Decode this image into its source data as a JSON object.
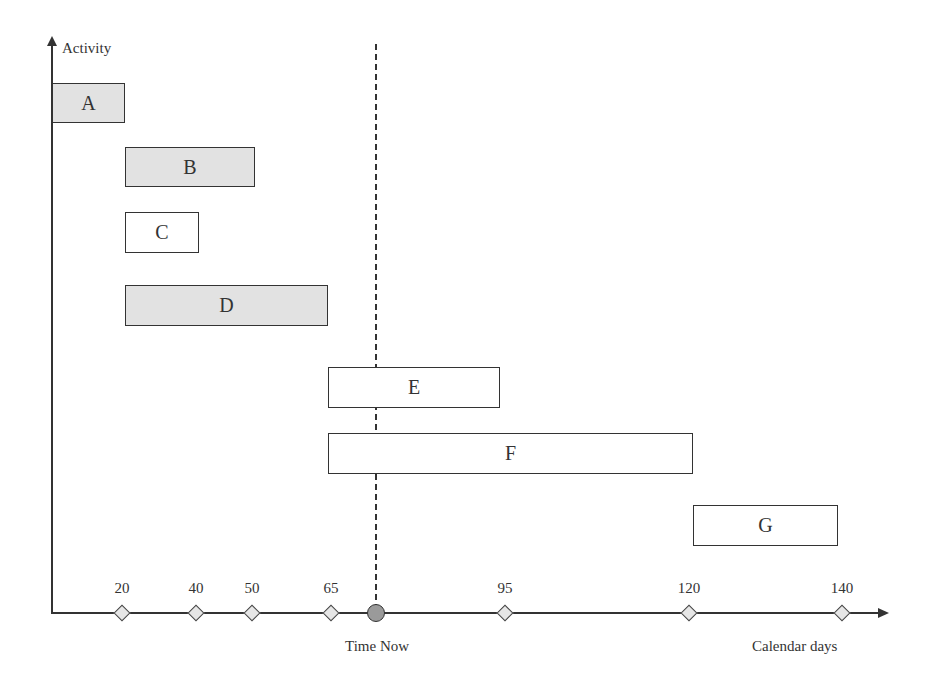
{
  "diagram": {
    "y_axis_label": "Activity",
    "x_axis_label": "Calendar days",
    "time_now": {
      "label": "Time Now",
      "x_px": 376
    },
    "activities": [
      {
        "name": "A",
        "filled": true,
        "x1": 52,
        "x2": 125,
        "y1": 83,
        "y2": 123
      },
      {
        "name": "B",
        "filled": true,
        "x1": 125,
        "x2": 255,
        "y1": 147,
        "y2": 187
      },
      {
        "name": "C",
        "filled": false,
        "x1": 125,
        "x2": 199,
        "y1": 212,
        "y2": 253
      },
      {
        "name": "D",
        "filled": true,
        "x1": 125,
        "x2": 328,
        "y1": 285,
        "y2": 326
      },
      {
        "name": "E",
        "filled": false,
        "x1": 328,
        "x2": 500,
        "y1": 367,
        "y2": 408
      },
      {
        "name": "F",
        "filled": false,
        "x1": 328,
        "x2": 693,
        "y1": 433,
        "y2": 474
      },
      {
        "name": "G",
        "filled": false,
        "x1": 693,
        "x2": 838,
        "y1": 505,
        "y2": 546
      }
    ],
    "milestones": [
      {
        "label": "20",
        "x_px": 122
      },
      {
        "label": "40",
        "x_px": 196
      },
      {
        "label": "50",
        "x_px": 252
      },
      {
        "label": "65",
        "x_px": 331
      },
      {
        "label": "95",
        "x_px": 505
      },
      {
        "label": "120",
        "x_px": 689
      },
      {
        "label": "140",
        "x_px": 842
      }
    ]
  }
}
